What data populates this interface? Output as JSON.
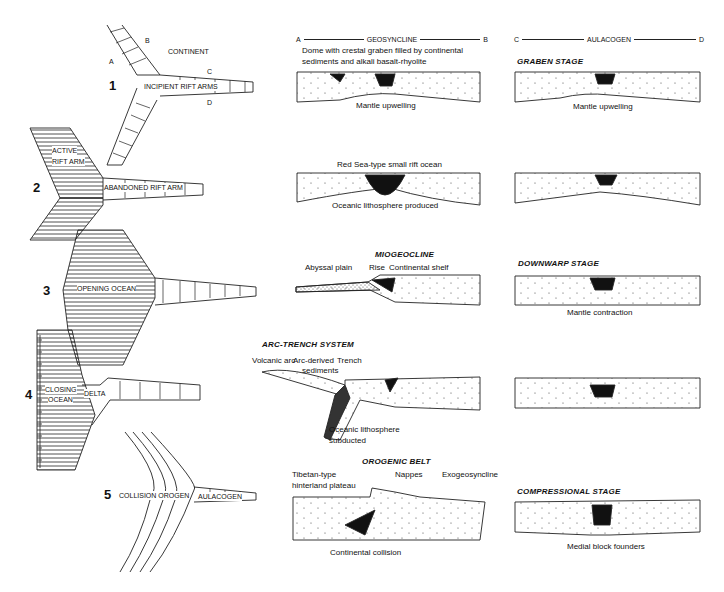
{
  "plan_views": {
    "stage1": {
      "number": "1",
      "labels": {
        "continent": "CONTINENT",
        "incipient": "INCIPIENT RIFT ARMS",
        "a": "A",
        "b": "B",
        "c": "C",
        "d": "D"
      }
    },
    "stage2": {
      "number": "2",
      "labels": {
        "active_1": "ACTIVE",
        "active_2": "RIFT ARM",
        "abandoned": "ABANDONED RIFT ARM"
      }
    },
    "stage3": {
      "number": "3",
      "labels": {
        "opening": "OPENING OCEAN"
      }
    },
    "stage4": {
      "number": "4",
      "labels": {
        "closing_1": "CLOSING",
        "closing_2": "OCEAN",
        "delta": "DELTA"
      }
    },
    "stage5": {
      "number": "5",
      "labels": {
        "collision": "COLLISION OROGEN",
        "aulacogen": "AULACOGEN"
      }
    }
  },
  "geosyncline_column": {
    "axis": {
      "left": "A",
      "title": "GEOSYNCLINE",
      "right": "B"
    },
    "panels": [
      {
        "caption_top_1": "Dome with crestal graben filled by continental",
        "caption_top_2": "sediments and alkali basalt-rhyolite",
        "caption_bottom": "Mantle upwelling"
      },
      {
        "caption_top": "Red Sea-type small rift ocean",
        "caption_bottom": "Oceanic lithosphere produced"
      },
      {
        "title": "MIOGEOCLINE",
        "label_abyssal": "Abyssal plain",
        "label_rise": "Rise",
        "label_shelf": "Continental shelf"
      },
      {
        "title": "ARC-TRENCH SYSTEM",
        "label_arc": "Volcanic arc",
        "label_arcsed_1": "Arc-derived",
        "label_arcsed_2": "sediments",
        "label_trench": "Trench",
        "label_sub_1": "Oceanic lithosphere",
        "label_sub_2": "subducted"
      },
      {
        "title": "OROGENIC BELT",
        "label_tibet_1": "Tibetan-type",
        "label_tibet_2": "hinterland plateau",
        "label_nappes": "Nappes",
        "label_exo": "Exogeosyncline",
        "caption_bottom": "Continental collision"
      }
    ]
  },
  "aulacogen_column": {
    "axis": {
      "left": "C",
      "title": "AULACOGEN",
      "right": "D"
    },
    "panels": [
      {
        "title": "GRABEN STAGE",
        "caption_bottom": "Mantle upwelling"
      },
      {},
      {
        "title": "DOWNWARP STAGE",
        "caption_bottom": "Mantle contraction"
      },
      {},
      {
        "title": "COMPRESSIONAL STAGE",
        "caption_bottom": "Medial block founders"
      }
    ]
  }
}
